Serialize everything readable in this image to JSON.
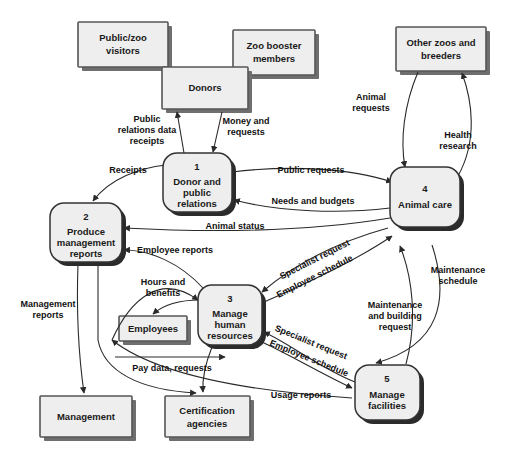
{
  "diagram": {
    "type": "data-flow-diagram",
    "background_color": "#ffffff",
    "entity_fill": "#eeeeee",
    "entity_stroke": "#555555",
    "process_fill": "#eeeeee",
    "process_stroke": "#333333",
    "flow_stroke": "#2a2a2a"
  },
  "entities": [
    {
      "id": "public_zoo_visitors",
      "label_line1": "Public/zoo",
      "label_line2": "visitors"
    },
    {
      "id": "donors",
      "label_line1": "Donors",
      "label_line2": ""
    },
    {
      "id": "zoo_booster_members",
      "label_line1": "Zoo booster",
      "label_line2": "members"
    },
    {
      "id": "other_zoos_and_breeders",
      "label_line1": "Other zoos and",
      "label_line2": "breeders"
    },
    {
      "id": "employees",
      "label_line1": "Employees",
      "label_line2": ""
    },
    {
      "id": "management",
      "label_line1": "Management",
      "label_line2": ""
    },
    {
      "id": "certification_agencies",
      "label_line1": "Certification",
      "label_line2": "agencies"
    }
  ],
  "processes": [
    {
      "id": "p1",
      "number": "1",
      "line1": "Donor and",
      "line2": "public",
      "line3": "relations"
    },
    {
      "id": "p2",
      "number": "2",
      "line1": "Produce",
      "line2": "management",
      "line3": "reports"
    },
    {
      "id": "p3",
      "number": "3",
      "line1": "Manage",
      "line2": "human",
      "line3": "resources"
    },
    {
      "id": "p4",
      "number": "4",
      "line1": "Animal care",
      "line2": "",
      "line3": ""
    },
    {
      "id": "p5",
      "number": "5",
      "line1": "Manage",
      "line2": "facilities",
      "line3": ""
    }
  ],
  "flows": [
    {
      "id": "f_public_relations_data_receipts",
      "line1": "Public",
      "line2": "relations data",
      "line3": "receipts"
    },
    {
      "id": "f_money_and_requests",
      "line1": "Money and",
      "line2": "requests",
      "line3": ""
    },
    {
      "id": "f_receipts",
      "line1": "Receipts",
      "line2": "",
      "line3": ""
    },
    {
      "id": "f_public_requests",
      "line1": "Public requests",
      "line2": "",
      "line3": ""
    },
    {
      "id": "f_needs_and_budgets",
      "line1": "Needs and budgets",
      "line2": "",
      "line3": ""
    },
    {
      "id": "f_animal_status",
      "line1": "Animal status",
      "line2": "",
      "line3": ""
    },
    {
      "id": "f_animal_requests",
      "line1": "Animal",
      "line2": "requests",
      "line3": ""
    },
    {
      "id": "f_health_research",
      "line1": "Health",
      "line2": "research",
      "line3": ""
    },
    {
      "id": "f_employee_reports",
      "line1": "Employee reports",
      "line2": "",
      "line3": ""
    },
    {
      "id": "f_hours_and_benefits",
      "line1": "Hours and",
      "line2": "benefits",
      "line3": ""
    },
    {
      "id": "f_specialist_request_top",
      "line1": "Specialist request",
      "line2": "",
      "line3": ""
    },
    {
      "id": "f_employee_schedule_top",
      "line1": "Employee schedule",
      "line2": "",
      "line3": ""
    },
    {
      "id": "f_specialist_request_bottom",
      "line1": "Specialist request",
      "line2": "",
      "line3": ""
    },
    {
      "id": "f_employee_schedule_bottom",
      "line1": "Employee schedule",
      "line2": "",
      "line3": ""
    },
    {
      "id": "f_maintenance_schedule",
      "line1": "Maintenance",
      "line2": "schedule",
      "line3": ""
    },
    {
      "id": "f_maintenance_and_building_request",
      "line1": "Maintenance",
      "line2": "and building",
      "line3": "request"
    },
    {
      "id": "f_management_reports",
      "line1": "Management",
      "line2": "reports",
      "line3": ""
    },
    {
      "id": "f_pay_data_requests",
      "line1": "Pay data, requests",
      "line2": "",
      "line3": ""
    },
    {
      "id": "f_usage_reports",
      "line1": "Usage reports",
      "line2": "",
      "line3": ""
    }
  ]
}
